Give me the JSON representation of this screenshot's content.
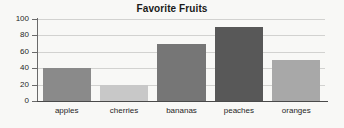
{
  "chart_data": {
    "type": "bar",
    "title": "Favorite Fruits",
    "xlabel": "",
    "ylabel": "",
    "categories": [
      "apples",
      "cherries",
      "bananas",
      "peaches",
      "oranges"
    ],
    "values": [
      40,
      20,
      70,
      90,
      50
    ],
    "ylim": [
      0,
      100
    ],
    "yticks": [
      0,
      20,
      40,
      60,
      80,
      100
    ],
    "grid": true,
    "legend": false,
    "bar_colors": [
      "#8a8a8a",
      "#c8c8c8",
      "#767676",
      "#585858",
      "#a8a8a8"
    ],
    "background_color": "#f8f8f6",
    "gridline_color": "#d2d2d0",
    "axis_color": "#4a4a4a",
    "text_color": "#1f1f1f"
  }
}
